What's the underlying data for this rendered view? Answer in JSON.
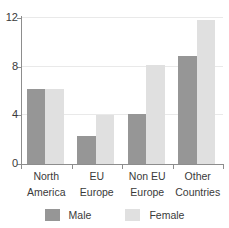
{
  "chart_data": {
    "type": "bar",
    "title": "",
    "xlabel": "",
    "ylabel": "",
    "categories": [
      "North America",
      "EU Europe",
      "Non EU Europe",
      "Other Countries"
    ],
    "category_lines": [
      [
        "North",
        "America"
      ],
      [
        "EU",
        "Europe"
      ],
      [
        "Non EU",
        "Europe"
      ],
      [
        "Other",
        "Countries"
      ]
    ],
    "series": [
      {
        "name": "Male",
        "color": "#969696",
        "values": [
          6.2,
          2.3,
          4.1,
          8.9
        ]
      },
      {
        "name": "Female",
        "color": "#e0e0e0",
        "values": [
          6.2,
          4.0,
          8.1,
          11.8
        ]
      }
    ],
    "ylim": [
      0,
      12
    ],
    "yticks": [
      0,
      4,
      8,
      12
    ],
    "ytick_labels": [
      "0",
      "4",
      "8",
      "12"
    ],
    "grid": true,
    "grid_axis": "y",
    "legend_position": "bottom"
  },
  "legend": {
    "items": [
      {
        "label": "Male",
        "color": "#969696"
      },
      {
        "label": "Female",
        "color": "#e0e0e0"
      }
    ]
  },
  "colors": {
    "male": "#969696",
    "female": "#e0e0e0",
    "axis": "#8d8d8d",
    "grid": "#e9e9e9",
    "text": "#3a3a3a",
    "background": "#ffffff"
  }
}
